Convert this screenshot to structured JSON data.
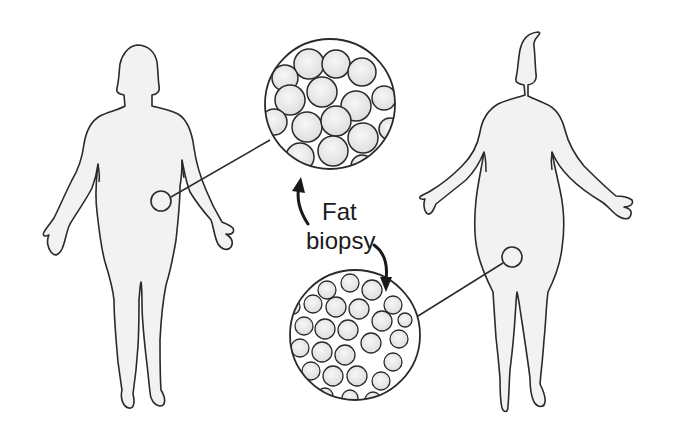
{
  "diagram": {
    "type": "illustration",
    "labels": {
      "line1": "Fat",
      "line2": "biopsy"
    },
    "figures": [
      {
        "name": "left-figure",
        "description": "less obese body silhouette",
        "biopsy_site": "abdomen",
        "magnified_view": "top-center circle with fewer, larger fat cells"
      },
      {
        "name": "right-figure",
        "description": "more obese body silhouette",
        "biopsy_site": "hip/thigh",
        "magnified_view": "bottom-center circle with many smaller fat cells"
      }
    ],
    "arrows": [
      {
        "name": "arrow-up-to-top-circle",
        "direction": "up"
      },
      {
        "name": "arrow-down-to-bottom-circle",
        "direction": "down"
      }
    ],
    "colors": {
      "outline": "#2a2a2a",
      "body_fill": "#f2f2f2",
      "cell_fill": "#e9e9e9",
      "background": "#ffffff"
    }
  }
}
